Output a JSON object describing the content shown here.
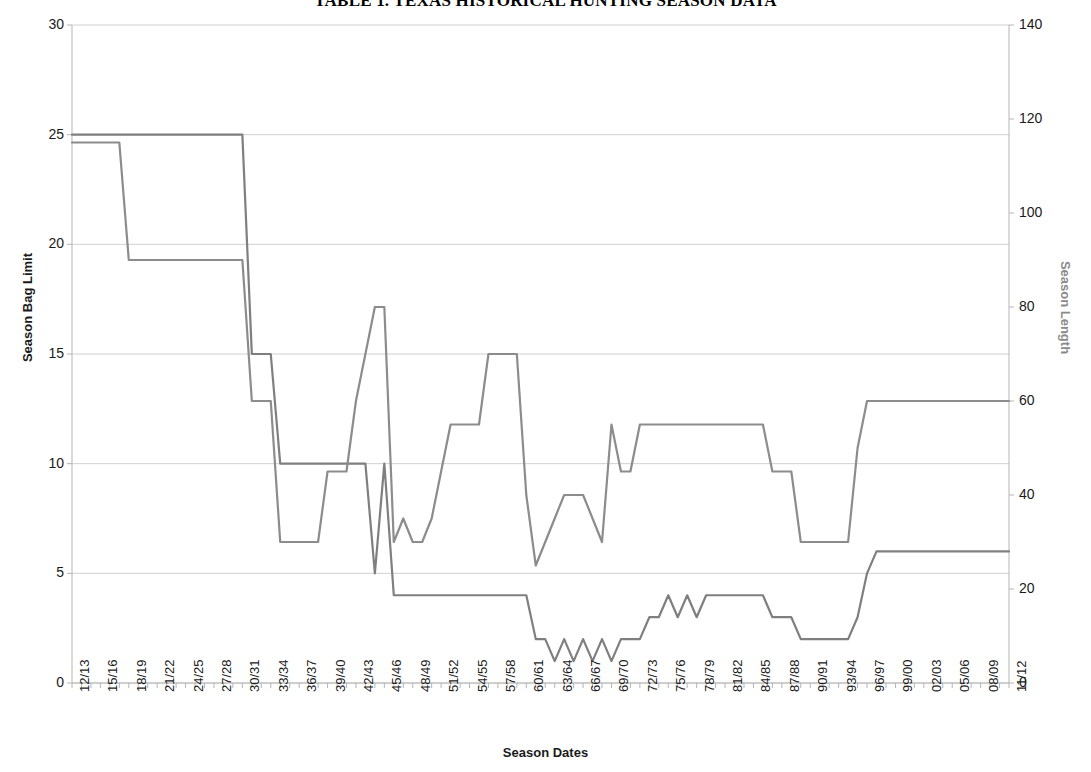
{
  "chart_data": {
    "type": "line",
    "title": "TABLE 1. TEXAS HISTORICAL HUNTING SEASON DATA",
    "xlabel": "Season Dates",
    "ylabel": "Season Bag Limit",
    "y2label": "Season Length",
    "ylim": [
      0,
      30
    ],
    "y2lim": [
      0,
      140
    ],
    "y_ticks": [
      0,
      5,
      10,
      15,
      20,
      25,
      30
    ],
    "y2_ticks": [
      0,
      20,
      40,
      60,
      80,
      100,
      120,
      140
    ],
    "grid": true,
    "legend": "none",
    "x_tick_labels": [
      "12/13",
      "15/16",
      "18/19",
      "21/22",
      "24/25",
      "27/28",
      "30/31",
      "33/34",
      "36/37",
      "39/40",
      "42/43",
      "45/46",
      "48/49",
      "51/52",
      "54/55",
      "57/58",
      "60/61",
      "63/64",
      "66/67",
      "69/70",
      "72/73",
      "75/76",
      "78/79",
      "81/82",
      "84/85",
      "87/88",
      "90/91",
      "93/94",
      "96/97",
      "99/00",
      "02/03",
      "05/06",
      "08/09",
      "11/12"
    ],
    "x_tick_step": 3,
    "x": [
      "12/13",
      "13/14",
      "14/15",
      "15/16",
      "16/17",
      "17/18",
      "18/19",
      "19/20",
      "20/21",
      "21/22",
      "22/23",
      "23/24",
      "24/25",
      "25/26",
      "26/27",
      "27/28",
      "28/29",
      "29/30",
      "30/31",
      "31/32",
      "32/33",
      "33/34",
      "34/35",
      "35/36",
      "36/37",
      "37/38",
      "38/39",
      "39/40",
      "40/41",
      "41/42",
      "42/43",
      "43/44",
      "44/45",
      "45/46",
      "46/47",
      "47/48",
      "48/49",
      "49/50",
      "50/51",
      "51/52",
      "52/53",
      "53/54",
      "54/55",
      "55/56",
      "56/57",
      "57/58",
      "58/59",
      "59/60",
      "60/61",
      "61/62",
      "62/63",
      "63/64",
      "64/65",
      "65/66",
      "66/67",
      "67/68",
      "68/69",
      "69/70",
      "70/71",
      "71/72",
      "72/73",
      "73/74",
      "74/75",
      "75/76",
      "76/77",
      "77/78",
      "78/79",
      "79/80",
      "80/81",
      "81/82",
      "82/83",
      "83/84",
      "84/85",
      "85/86",
      "86/87",
      "87/88",
      "88/89",
      "89/90",
      "90/91",
      "91/92",
      "92/93",
      "93/94",
      "94/95",
      "95/96",
      "96/97",
      "97/98",
      "98/99",
      "99/00",
      "00/01",
      "01/02",
      "02/03",
      "03/04",
      "04/05",
      "05/06",
      "06/07",
      "07/08",
      "08/09",
      "09/10",
      "10/11",
      "11/12"
    ],
    "series": [
      {
        "name": "Season Bag Limit",
        "axis": "left",
        "color": "#7f7f7f",
        "units": "birds",
        "values": [
          25,
          25,
          25,
          25,
          25,
          25,
          25,
          25,
          25,
          25,
          25,
          25,
          25,
          25,
          25,
          25,
          25,
          25,
          25,
          15,
          15,
          15,
          10,
          10,
          10,
          10,
          10,
          10,
          10,
          10,
          10,
          10,
          5,
          10,
          4,
          4,
          4,
          4,
          4,
          4,
          4,
          4,
          4,
          4,
          4,
          4,
          4,
          4,
          4,
          2,
          2,
          1,
          2,
          1,
          2,
          1,
          2,
          1,
          2,
          2,
          2,
          3,
          3,
          4,
          3,
          4,
          3,
          4,
          4,
          4,
          4,
          4,
          4,
          4,
          3,
          3,
          3,
          2,
          2,
          2,
          2,
          2,
          2,
          3,
          5,
          6,
          6,
          6,
          6,
          6,
          6,
          6,
          6,
          6,
          6,
          6,
          6,
          6,
          6,
          6
        ]
      },
      {
        "name": "Season Length",
        "axis": "right",
        "color": "#8c8c8c",
        "units": "days",
        "values": [
          115,
          115,
          115,
          115,
          115,
          115,
          90,
          90,
          90,
          90,
          90,
          90,
          90,
          90,
          90,
          90,
          90,
          90,
          90,
          60,
          60,
          60,
          30,
          30,
          30,
          30,
          30,
          45,
          45,
          45,
          60,
          70,
          80,
          80,
          30,
          35,
          30,
          30,
          35,
          45,
          55,
          55,
          55,
          55,
          70,
          70,
          70,
          70,
          40,
          25,
          30,
          35,
          40,
          40,
          40,
          35,
          30,
          55,
          45,
          45,
          55,
          55,
          55,
          55,
          55,
          55,
          55,
          55,
          55,
          55,
          55,
          55,
          55,
          55,
          45,
          45,
          45,
          30,
          30,
          30,
          30,
          30,
          30,
          50,
          60,
          60,
          60,
          60,
          60,
          60,
          60,
          60,
          60,
          60,
          60,
          60,
          60,
          60,
          60,
          60
        ]
      }
    ]
  },
  "axes": {
    "left_title": "Season Bag Limit",
    "right_title": "Season Length",
    "bottom_title": "Season Dates",
    "left_tick_labels": [
      "30",
      "25",
      "20",
      "15",
      "10",
      "5",
      "0"
    ],
    "right_tick_labels": [
      "140",
      "120",
      "100",
      "80",
      "60",
      "40",
      "20",
      "0"
    ]
  },
  "colors": {
    "bag_limit_line": "#7f7f7f",
    "season_length_line": "#8c8c8c",
    "gridline": "#d0d0d0",
    "axis": "#b5b5b5",
    "text": "#1a1a1a",
    "right_axis_title": "#8a8a8a"
  }
}
